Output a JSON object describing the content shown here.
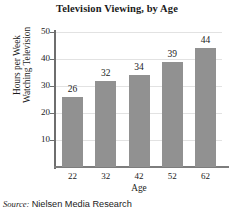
{
  "chart_data": {
    "type": "bar",
    "title": "Television Viewing, by Age",
    "categories": [
      "22",
      "32",
      "42",
      "52",
      "62"
    ],
    "values": [
      26,
      32,
      34,
      39,
      44
    ],
    "xlabel": "Age",
    "ylabel": "Hours per Week Watching Television",
    "ylabel_lines": [
      "Hours per Week",
      "Watching Television"
    ],
    "yticks": [
      10,
      20,
      30,
      40,
      50
    ],
    "ylim": [
      0,
      50
    ],
    "grid": true,
    "legend": "none",
    "bar_color": "#919191",
    "axis_color": "#6e6e6e",
    "gridline_color": "#e2e2e2",
    "text_color": "#1b1b1b"
  },
  "source": {
    "label": "Source:",
    "text": "Nielsen Media Research"
  }
}
